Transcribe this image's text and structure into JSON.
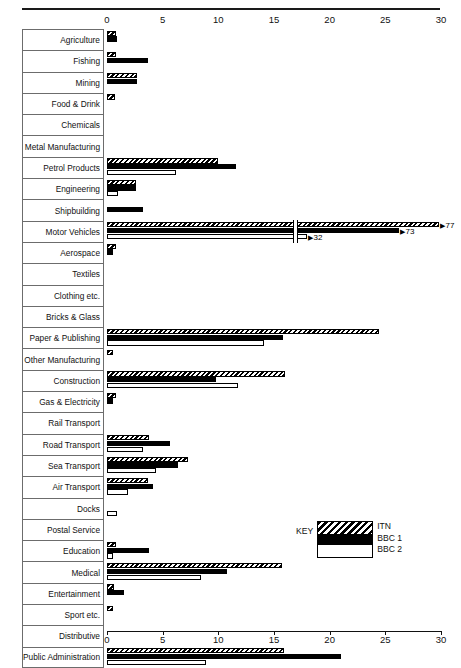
{
  "chart_data": {
    "type": "bar",
    "orientation": "horizontal",
    "title": "",
    "xlabel": "",
    "ylabel": "",
    "xlim": [
      0,
      30
    ],
    "xticks": [
      0,
      5,
      10,
      15,
      20,
      25,
      30
    ],
    "xtick_labels": [
      "0",
      "5",
      "10",
      "15",
      "20",
      "25",
      "30"
    ],
    "grid": false,
    "legend": {
      "title": "KEY",
      "position": "inside-right",
      "entries": [
        {
          "name": "ITN",
          "pattern": "diagonal-hatch"
        },
        {
          "name": "BBC 1",
          "pattern": "solid-black"
        },
        {
          "name": "BBC 2",
          "pattern": "white-outline"
        }
      ]
    },
    "categories": [
      "Agriculture",
      "Fishing",
      "Mining",
      "Food & Drink",
      "Chemicals",
      "Metal Manufacturing",
      "Petrol Products",
      "Engineering",
      "Shipbuilding",
      "Motor Vehicles",
      "Aerospace",
      "Textiles",
      "Clothing etc.",
      "Bricks & Glass",
      "Paper & Publishing",
      "Other Manufacturing",
      "Construction",
      "Gas & Electricity",
      "Rail Transport",
      "Road Transport",
      "Sea Transport",
      "Air Transport",
      "Docks",
      "Postal Service",
      "Education",
      "Medical",
      "Entertainment",
      "Sport etc.",
      "Distributive",
      "Public Administration"
    ],
    "series": [
      {
        "name": "ITN",
        "values": [
          0.8,
          0.8,
          2.7,
          0.7,
          0,
          0,
          10.0,
          2.6,
          0,
          77,
          0.8,
          0,
          0,
          0,
          24.4,
          0.5,
          16.0,
          0.8,
          0,
          3.8,
          7.3,
          3.7,
          0,
          0,
          0.8,
          15.7,
          0.6,
          0.5,
          0,
          15.9
        ]
      },
      {
        "name": "BBC 1",
        "values": [
          0.9,
          3.7,
          2.7,
          0,
          0,
          0,
          11.6,
          2.6,
          3.2,
          73,
          0.5,
          0,
          0,
          0,
          15.8,
          0,
          9.8,
          0.5,
          0,
          5.7,
          6.4,
          4.1,
          0,
          0,
          3.8,
          10.8,
          1.5,
          0,
          0,
          21.0
        ]
      },
      {
        "name": "BBC 2",
        "values": [
          0,
          0,
          0,
          0,
          0,
          0,
          6.2,
          1.0,
          0,
          32,
          0,
          0,
          0,
          0,
          14.1,
          0,
          11.8,
          0,
          0,
          3.2,
          4.4,
          1.9,
          0.9,
          0,
          0.5,
          8.4,
          0,
          0,
          0,
          8.9
        ]
      }
    ],
    "broken_axis_row": {
      "category": "Motor Vehicles",
      "note": "bars broken; actual values annotated at bar ends",
      "annotations": [
        {
          "series": "ITN",
          "label": "77"
        },
        {
          "series": "BBC 1",
          "label": "73"
        },
        {
          "series": "BBC 2",
          "label": "32"
        }
      ]
    }
  }
}
